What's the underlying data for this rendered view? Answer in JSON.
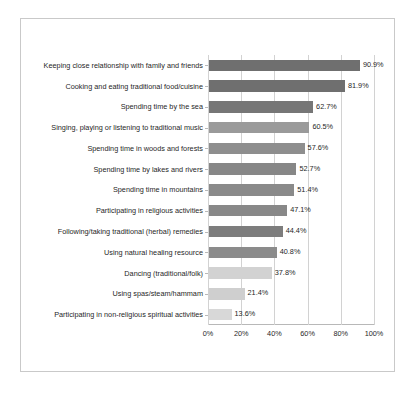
{
  "chart_data": {
    "type": "bar",
    "orientation": "horizontal",
    "title": "",
    "subtitle": "",
    "xlabel": "",
    "ylabel": "",
    "xlim": [
      0,
      100
    ],
    "xticks": [
      "0%",
      "20%",
      "40%",
      "60%",
      "80%",
      "100%"
    ],
    "xtick_values": [
      0,
      20,
      40,
      60,
      80,
      100
    ],
    "grid": true,
    "legend": false,
    "value_label_suffix": "%",
    "categories": [
      "Keeping close relationship with family and friends",
      "Cooking and eating traditional food/cuisine",
      "Spending time by the sea",
      "Singing, playing or listening to traditional music",
      "Spending time in woods and forests",
      "Spending time by lakes and rivers",
      "Spending time in mountains",
      "Participating in religious activities",
      "Following/taking traditional (herbal) remedies",
      "Using natural healing resource",
      "Dancing (traditional/folk)",
      "Using spas/steam/hammam",
      "Participating in non-religious spiritual activities"
    ],
    "values": [
      90.9,
      81.9,
      62.7,
      60.5,
      57.6,
      52.7,
      51.4,
      47.1,
      44.4,
      40.8,
      37.8,
      21.4,
      13.6
    ],
    "value_labels": [
      "90.9%",
      "81.9%",
      "62.7%",
      "60.5%",
      "57.6%",
      "52.7%",
      "51.4%",
      "47.1%",
      "44.4%",
      "40.8%",
      "37.8%",
      "21.4%",
      "13.6%"
    ],
    "bar_colors": [
      "#6f6f6f",
      "#6f6f6f",
      "#767676",
      "#9a9a9a",
      "#8e8e8e",
      "#878787",
      "#8a8a8a",
      "#888888",
      "#7d7d7d",
      "#8b8b8b",
      "#d2d2d2",
      "#cfcfcf",
      "#d8d8d8"
    ],
    "colors": {
      "background": "#ffffff",
      "frame_border": "#c9c9c9",
      "axis": "#b8b8b8",
      "gridline": "#d2d2d2",
      "text": "#1f1f1f"
    }
  }
}
